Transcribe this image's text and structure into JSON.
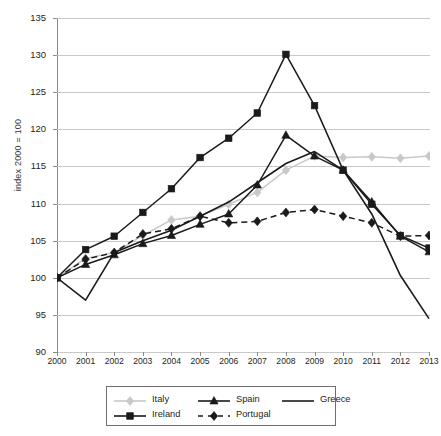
{
  "axes": {
    "ylabel": "index 2000 = 100",
    "yticks": [
      90,
      95,
      100,
      105,
      110,
      115,
      120,
      125,
      130,
      135
    ],
    "ymin": 90,
    "ymax": 135,
    "xticks": [
      "2000",
      "2001",
      "2002",
      "2003",
      "2004",
      "2005",
      "2006",
      "2007",
      "2008",
      "2009",
      "2010",
      "2011",
      "2012",
      "2013"
    ]
  },
  "legend": {
    "rows": [
      [
        {
          "label": "Italy",
          "marker": "diamond",
          "color": "#c8c8c8",
          "dash": "solid"
        },
        {
          "label": "Spain",
          "marker": "triangle",
          "color": "#1a1a1a",
          "dash": "solid"
        },
        {
          "label": "Greece",
          "marker": "none",
          "color": "#1a1a1a",
          "dash": "solid"
        }
      ],
      [
        {
          "label": "Ireland",
          "marker": "square",
          "color": "#1a1a1a",
          "dash": "solid"
        },
        {
          "label": "Portugal",
          "marker": "diamond",
          "color": "#1a1a1a",
          "dash": "dashed"
        }
      ]
    ]
  },
  "chart_data": {
    "type": "line",
    "title": "",
    "xlabel": "",
    "ylabel": "index 2000 = 100",
    "ylim": [
      90,
      135
    ],
    "grid": true,
    "legend_position": "bottom",
    "x": [
      "2000",
      "2001",
      "2002",
      "2003",
      "2004",
      "2005",
      "2006",
      "2007",
      "2008",
      "2009",
      "2010",
      "2011",
      "2012",
      "2013"
    ],
    "series": [
      {
        "name": "Italy",
        "color": "#c8c8c8",
        "marker": "diamond",
        "dash": "solid",
        "values": [
          100.0,
          102.6,
          103.4,
          105.7,
          107.8,
          108.3,
          109.9,
          111.5,
          114.5,
          116.4,
          116.2,
          116.3,
          116.1,
          116.4
        ]
      },
      {
        "name": "Spain",
        "color": "#1a1a1a",
        "marker": "triangle",
        "dash": "solid",
        "values": [
          100.0,
          101.8,
          103.1,
          104.6,
          105.7,
          107.2,
          108.6,
          112.5,
          119.2,
          116.4,
          114.5,
          110.2,
          105.6,
          103.5
        ]
      },
      {
        "name": "Greece",
        "color": "#1a1a1a",
        "marker": "none",
        "dash": "solid",
        "values": [
          100.0,
          97.0,
          103.4,
          105.0,
          106.4,
          108.3,
          110.2,
          112.8,
          115.4,
          117.0,
          114.5,
          108.6,
          100.3,
          94.5
        ]
      },
      {
        "name": "Ireland",
        "color": "#1a1a1a",
        "marker": "square",
        "dash": "solid",
        "values": [
          100.0,
          103.8,
          105.6,
          108.8,
          112.0,
          116.2,
          118.8,
          122.2,
          130.1,
          123.2,
          114.5,
          109.9,
          105.7,
          104.0
        ]
      },
      {
        "name": "Portugal",
        "color": "#1a1a1a",
        "marker": "diamond",
        "dash": "dashed",
        "values": [
          100.0,
          102.5,
          103.4,
          105.9,
          106.6,
          108.3,
          107.4,
          107.6,
          108.8,
          109.2,
          108.3,
          107.4,
          105.6,
          105.7
        ]
      }
    ]
  }
}
